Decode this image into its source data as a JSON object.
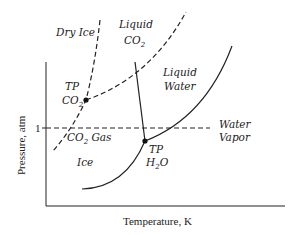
{
  "diagram": {
    "axes": {
      "xlabel": "Temperature, K",
      "ylabel": "Pressure, atm",
      "ytick": "1"
    },
    "regions": {
      "dry_ice": "Dry Ice",
      "liquid_co2_line1": "Liquid",
      "liquid_co2_line2": "CO",
      "liquid_co2_sub": "2",
      "liquid_water_line1": "Liquid",
      "liquid_water_line2": "Water",
      "co2_gas_pre": "CO",
      "co2_gas_sub": "2",
      "co2_gas_post": " Gas",
      "ice": "Ice",
      "water_vapor_line1": "Water",
      "water_vapor_line2": "Vapor"
    },
    "points": {
      "tp_co2_line1": "TP",
      "tp_co2_line2": "CO",
      "tp_co2_sub": "2",
      "tp_h2o_line1": "TP",
      "tp_h2o_pre": "H",
      "tp_h2o_sub": "2",
      "tp_h2o_post": "O"
    },
    "line_color": "#222222"
  }
}
